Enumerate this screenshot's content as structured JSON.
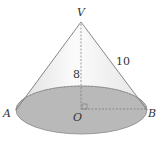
{
  "figure": {
    "type": "right circular cone",
    "points": {
      "apex": "V",
      "center": "O",
      "left": "A",
      "right": "B"
    },
    "measurements": {
      "height": "8",
      "slant": "10"
    },
    "colors": {
      "base_fill": "#b8b8b8",
      "body_fill": "#f0f0f0",
      "edge": "#777777"
    }
  }
}
